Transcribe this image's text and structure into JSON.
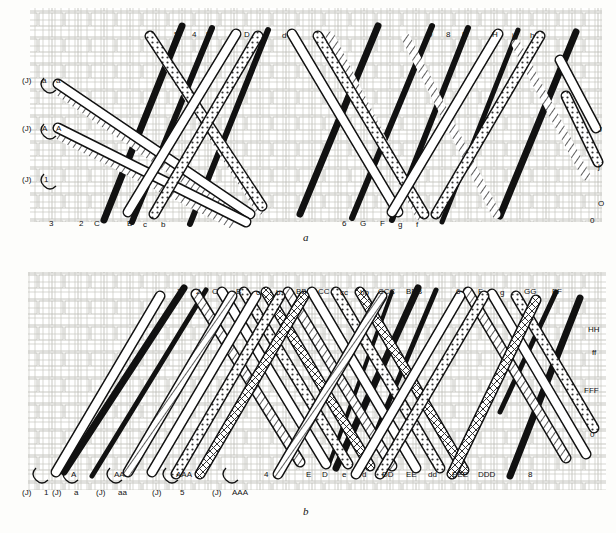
{
  "figure": {
    "title_a": "a",
    "title_b": "b",
    "type": "braid-diagram"
  },
  "panel_a": {
    "caption": "a",
    "top_labels": [
      "5",
      "4",
      "E",
      "D",
      "e",
      "d",
      "9",
      "8",
      "I",
      "H",
      "i",
      "h"
    ],
    "bottom_labels": [
      "3",
      "2",
      "C",
      "B",
      "c",
      "b",
      "6",
      "G",
      "F",
      "g",
      "f",
      "0"
    ],
    "left_labels": [
      "a",
      "a",
      "A",
      "A",
      "1"
    ],
    "right_labels": [
      "J",
      "j",
      "O"
    ],
    "left_markers": [
      "(J)",
      "(J)",
      "(J)"
    ]
  },
  "panel_b": {
    "caption": "b",
    "top_labels": [
      "3",
      "2",
      "C",
      "B",
      "c",
      "b",
      "BB",
      "CC",
      "cc",
      "bb",
      "CCC",
      "BBB",
      "7",
      "6",
      "F",
      "g",
      "GG",
      "FF"
    ],
    "right_labels": [
      "HH",
      "ff",
      "FFF",
      "0"
    ],
    "bottom_labels": [
      "1",
      "A",
      "a",
      "AA",
      "aa",
      "AAA",
      "5",
      "4",
      "E",
      "D",
      "e",
      "d",
      "DD",
      "EE",
      "dd",
      "EEE",
      "DDD",
      "9",
      "8"
    ],
    "left_markers": [
      "(J)",
      "(J)",
      "(J)",
      "(J)",
      "(J)"
    ],
    "left_marker_labels": [
      "1",
      "A",
      "a",
      "AA",
      "aa",
      "AAA"
    ]
  },
  "colors": {
    "ink": "#111111",
    "background": "#fdfdfb",
    "weave": "#c9c9c4",
    "hatch": "#555555"
  }
}
